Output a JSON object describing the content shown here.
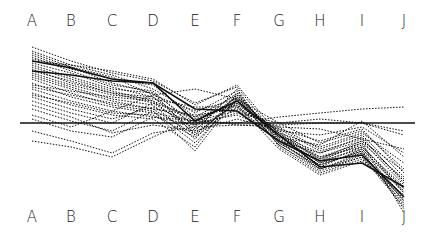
{
  "chart_data": {
    "type": "line",
    "subtype": "profile-plot",
    "title": "",
    "xlabel": "",
    "ylabel": "",
    "categories": [
      "A",
      "B",
      "C",
      "D",
      "E",
      "F",
      "G",
      "H",
      "I",
      "J"
    ],
    "top_axis_labels": [
      "A",
      "B",
      "C",
      "D",
      "E",
      "F",
      "G",
      "H",
      "I",
      "J"
    ],
    "bottom_axis_labels": [
      "A",
      "B",
      "C",
      "D",
      "E",
      "F",
      "G",
      "H",
      "I",
      "J"
    ],
    "reference_line": {
      "y": 0,
      "style": "solid"
    },
    "ylim": [
      -100,
      80
    ],
    "grid": false,
    "legend": null,
    "colors": {
      "line": "#111111",
      "background": "#ffffff"
    },
    "mean_series": [
      {
        "name": "mean-1",
        "style": "solid",
        "values": [
          62,
          55,
          44,
          40,
          14,
          12,
          -18,
          -38,
          -32,
          -74
        ]
      },
      {
        "name": "mean-2",
        "style": "solid",
        "values": [
          52,
          48,
          42,
          40,
          2,
          22,
          -12,
          -44,
          -40,
          -64
        ]
      }
    ],
    "series": [
      {
        "name": "s1",
        "style": "dotted",
        "values": [
          76,
          62,
          50,
          42,
          20,
          36,
          -16,
          -38,
          -20,
          -90
        ]
      },
      {
        "name": "s2",
        "style": "dotted",
        "values": [
          72,
          58,
          48,
          34,
          10,
          32,
          -20,
          -42,
          -28,
          -86
        ]
      },
      {
        "name": "s3",
        "style": "dotted",
        "values": [
          70,
          56,
          40,
          30,
          0,
          30,
          -18,
          -46,
          -32,
          -82
        ]
      },
      {
        "name": "s4",
        "style": "dotted",
        "values": [
          68,
          54,
          44,
          38,
          6,
          28,
          -14,
          -40,
          -30,
          -78
        ]
      },
      {
        "name": "s5",
        "style": "dotted",
        "values": [
          66,
          52,
          38,
          32,
          -4,
          26,
          -22,
          -48,
          -34,
          -80
        ]
      },
      {
        "name": "s6",
        "style": "dotted",
        "values": [
          64,
          56,
          46,
          28,
          12,
          24,
          -10,
          -36,
          -22,
          -70
        ]
      },
      {
        "name": "s7",
        "style": "dotted",
        "values": [
          60,
          50,
          36,
          26,
          -8,
          34,
          -24,
          -50,
          -36,
          -76
        ]
      },
      {
        "name": "s8",
        "style": "dotted",
        "values": [
          58,
          46,
          34,
          30,
          -12,
          22,
          -20,
          -44,
          -26,
          -68
        ]
      },
      {
        "name": "s9",
        "style": "dotted",
        "values": [
          56,
          44,
          32,
          22,
          4,
          20,
          -12,
          -30,
          -14,
          -60
        ]
      },
      {
        "name": "s10",
        "style": "dotted",
        "values": [
          54,
          40,
          30,
          20,
          -6,
          18,
          -26,
          -52,
          -38,
          -72
        ]
      },
      {
        "name": "s11",
        "style": "dotted",
        "values": [
          50,
          38,
          28,
          24,
          16,
          16,
          -8,
          -34,
          -24,
          -66
        ]
      },
      {
        "name": "s12",
        "style": "dotted",
        "values": [
          48,
          36,
          24,
          18,
          -16,
          28,
          -16,
          -42,
          -28,
          -74
        ]
      },
      {
        "name": "s13",
        "style": "dotted",
        "values": [
          46,
          34,
          22,
          14,
          8,
          14,
          -6,
          -28,
          -16,
          -58
        ]
      },
      {
        "name": "s14",
        "style": "dotted",
        "values": [
          44,
          30,
          18,
          12,
          -20,
          24,
          -22,
          -46,
          -34,
          -84
        ]
      },
      {
        "name": "s15",
        "style": "dotted",
        "values": [
          40,
          26,
          16,
          10,
          2,
          12,
          -4,
          -26,
          -12,
          -54
        ]
      },
      {
        "name": "s16",
        "style": "dotted",
        "values": [
          38,
          32,
          26,
          22,
          -10,
          20,
          -12,
          -40,
          -24,
          -64
        ]
      },
      {
        "name": "s17",
        "style": "dotted",
        "values": [
          34,
          22,
          12,
          6,
          -2,
          10,
          0,
          -20,
          -8,
          -46
        ]
      },
      {
        "name": "s18",
        "style": "dotted",
        "values": [
          30,
          18,
          8,
          4,
          -24,
          30,
          -18,
          -46,
          -30,
          -78
        ]
      },
      {
        "name": "s19",
        "style": "dotted",
        "values": [
          26,
          14,
          4,
          16,
          0,
          8,
          -10,
          -24,
          -10,
          -40
        ]
      },
      {
        "name": "s20",
        "style": "dotted",
        "values": [
          22,
          10,
          0,
          20,
          6,
          18,
          -8,
          -12,
          -4,
          -30
        ]
      },
      {
        "name": "s21",
        "style": "dotted",
        "values": [
          18,
          6,
          -10,
          -2,
          -8,
          4,
          -6,
          -18,
          -6,
          -50
        ]
      },
      {
        "name": "s22",
        "style": "dotted",
        "values": [
          14,
          2,
          -8,
          12,
          -28,
          26,
          -14,
          -22,
          2,
          -34
        ]
      },
      {
        "name": "s23",
        "style": "dotted",
        "values": [
          8,
          -4,
          12,
          28,
          34,
          24,
          0,
          4,
          0,
          -12
        ]
      },
      {
        "name": "s24",
        "style": "dotted",
        "values": [
          4,
          -8,
          -14,
          6,
          2,
          0,
          6,
          10,
          14,
          16
        ]
      },
      {
        "name": "s25",
        "style": "dotted",
        "values": [
          -8,
          -18,
          -30,
          -10,
          -4,
          -2,
          -2,
          0,
          0,
          -8
        ]
      },
      {
        "name": "s26",
        "style": "dotted",
        "values": [
          -18,
          -24,
          -34,
          -14,
          4,
          -2,
          -4,
          -6,
          -16,
          -26
        ]
      },
      {
        "name": "s27",
        "style": "dotted",
        "values": [
          62,
          58,
          52,
          44,
          18,
          38,
          -12,
          -36,
          -18,
          -62
        ]
      },
      {
        "name": "s28",
        "style": "dotted",
        "values": [
          36,
          28,
          20,
          14,
          -12,
          22,
          -14,
          -34,
          -20,
          -56
        ]
      },
      {
        "name": "s29",
        "style": "dotted",
        "values": [
          28,
          20,
          10,
          8,
          -14,
          16,
          -18,
          -30,
          -18,
          -48
        ]
      },
      {
        "name": "s30",
        "style": "dotted",
        "values": [
          52,
          42,
          30,
          26,
          -2,
          26,
          -10,
          -38,
          -26,
          -70
        ]
      }
    ]
  },
  "layout": {
    "x_positions": [
      32,
      71,
      112,
      153,
      195,
      237,
      279,
      320,
      362,
      404
    ],
    "baseline_y": 123,
    "px_per_unit": 1,
    "top_label_y": 26,
    "bottom_label_y": 222,
    "reference_line_x": [
      20,
      415
    ]
  }
}
